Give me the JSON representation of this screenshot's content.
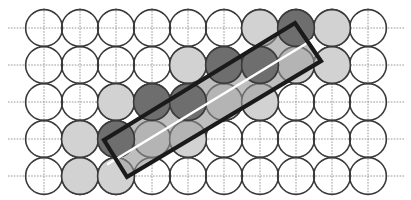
{
  "figure": {
    "width": 411,
    "height": 200,
    "background_color": "#ffffff"
  },
  "lattice": {
    "type": "square",
    "columns": 10,
    "rows": 5,
    "origin_x": 44,
    "origin_y": 28,
    "spacing_x": 36,
    "spacing_y": 37,
    "circle_radius": 18.4,
    "circle_stroke_color": "#3a3a3a",
    "circle_stroke_width": 1.6,
    "circle_fill_color": "none"
  },
  "gridlines": {
    "visible": true,
    "color": "#8c8c8c",
    "width": 0.9,
    "style": "dotted-thin",
    "horizontal_count": 5,
    "vertical_count": 10,
    "horizontal_y": [
      28,
      65,
      102,
      139,
      176
    ],
    "vertical_x": [
      44,
      80,
      116,
      152,
      188,
      224,
      260,
      296,
      332,
      368
    ],
    "h_extent": [
      8,
      404
    ],
    "v_extent": [
      8,
      196
    ]
  },
  "shading": {
    "dark_fill": "#6e6e6e",
    "dark_stroke": "#3a3a3a",
    "light_fill": "#d2d2d2",
    "light_stroke": "#3a3a3a",
    "band_fill": "#9a9a9a",
    "band_opacity": 0.55
  },
  "shaded_circles": {
    "dark": [
      {
        "col": 2,
        "row": 3,
        "cx": 116,
        "cy": 139
      },
      {
        "col": 3,
        "row": 2,
        "cx": 152,
        "cy": 102
      },
      {
        "col": 4,
        "row": 2,
        "cx": 188,
        "cy": 102
      },
      {
        "col": 5,
        "row": 1,
        "cx": 224,
        "cy": 65
      },
      {
        "col": 6,
        "row": 1,
        "cx": 260,
        "cy": 65
      },
      {
        "col": 7,
        "row": 0,
        "cx": 296,
        "cy": 28
      }
    ],
    "light": [
      {
        "col": 1,
        "row": 4,
        "cx": 80,
        "cy": 176
      },
      {
        "col": 2,
        "row": 4,
        "cx": 116,
        "cy": 176
      },
      {
        "col": 1,
        "row": 3,
        "cx": 80,
        "cy": 139
      },
      {
        "col": 3,
        "row": 3,
        "cx": 152,
        "cy": 139
      },
      {
        "col": 4,
        "row": 3,
        "cx": 188,
        "cy": 139
      },
      {
        "col": 2,
        "row": 2,
        "cx": 116,
        "cy": 102
      },
      {
        "col": 5,
        "row": 2,
        "cx": 224,
        "cy": 102
      },
      {
        "col": 6,
        "row": 2,
        "cx": 260,
        "cy": 102
      },
      {
        "col": 4,
        "row": 1,
        "cx": 188,
        "cy": 65
      },
      {
        "col": 7,
        "row": 1,
        "cx": 296,
        "cy": 65
      },
      {
        "col": 8,
        "row": 1,
        "cx": 332,
        "cy": 65
      },
      {
        "col": 6,
        "row": 0,
        "cx": 260,
        "cy": 28
      },
      {
        "col": 8,
        "row": 0,
        "cx": 332,
        "cy": 28
      }
    ]
  },
  "unit_cell": {
    "label": "tilted rectangular unit cell",
    "stroke_color": "#1a1a1a",
    "stroke_width": 4.2,
    "fill": "none",
    "corners": [
      {
        "name": "left",
        "x": 104,
        "y": 140
      },
      {
        "name": "top",
        "x": 295,
        "y": 23
      },
      {
        "name": "right",
        "x": 321,
        "y": 61
      },
      {
        "name": "bottom",
        "x": 127,
        "y": 177
      }
    ],
    "tilt_angle_deg": 31.5
  },
  "diagonal_line": {
    "label": "white diagonal axis line",
    "color": "#ffffff",
    "width": 2.6,
    "x1": 108,
    "y1": 164,
    "x2": 312,
    "y2": 40
  }
}
